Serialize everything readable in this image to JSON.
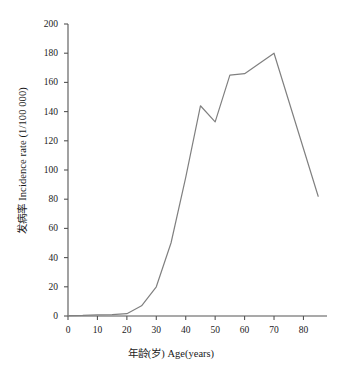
{
  "chart_data": {
    "type": "line",
    "title": "",
    "subtitle": "",
    "xlabel": "年龄(岁) Age(years)",
    "ylabel": "发病率 Incidence rate (1/100 000)",
    "xlim": [
      0,
      88
    ],
    "ylim": [
      0,
      200
    ],
    "xticks": [
      0,
      10,
      20,
      30,
      40,
      50,
      60,
      70,
      80
    ],
    "xtick_labels": [
      "0",
      "10",
      "20",
      "30",
      "40",
      "50",
      "60",
      "70",
      "80"
    ],
    "yticks": [
      0,
      20,
      40,
      60,
      80,
      100,
      120,
      140,
      160,
      180,
      200
    ],
    "ytick_labels": [
      "0",
      "20",
      "40",
      "60",
      "80",
      "100",
      "120",
      "140",
      "160",
      "180",
      "200"
    ],
    "grid": false,
    "legend": null,
    "line_color": "#808080",
    "line_width": 1.2,
    "x": [
      0,
      5,
      10,
      15,
      20,
      25,
      30,
      35,
      40,
      45,
      50,
      55,
      60,
      65,
      70,
      85
    ],
    "series": [
      {
        "name": "Incidence rate",
        "values": [
          0.3,
          0.4,
          0.8,
          1.0,
          1.6,
          7,
          20,
          50,
          95,
          144,
          133,
          165,
          166,
          173,
          180,
          82
        ]
      }
    ]
  },
  "axes": {
    "y_axis_title": "发病率 Incidence rate (1/100 000)",
    "x_axis_title": "年龄(岁) Age(years)"
  }
}
